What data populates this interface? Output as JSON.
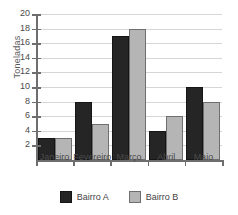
{
  "chart_data": {
    "type": "bar",
    "title": "",
    "subtitle": "",
    "xlabel": "",
    "ylabel": "Toneladas",
    "categories": [
      "Janeiro",
      "Fevereiro",
      "Março",
      "Abril",
      "Maio"
    ],
    "series": [
      {
        "name": "Bairro A",
        "values": [
          3,
          8,
          17,
          4,
          10
        ],
        "color": "#252525"
      },
      {
        "name": "Bairro B",
        "values": [
          3,
          5,
          18,
          6,
          8
        ],
        "color": "#b5b5b5"
      }
    ],
    "ylim": [
      0,
      20
    ],
    "ytick_step": 2,
    "ytick_labels": [
      "2",
      "4",
      "6",
      "8",
      "10",
      "12",
      "14",
      "16",
      "18",
      "20"
    ],
    "grid": true,
    "grid_color": "#d6d6d6",
    "axis_color": "#6e6e6e",
    "legend_position": "bottom-center",
    "background": "#ffffff"
  }
}
